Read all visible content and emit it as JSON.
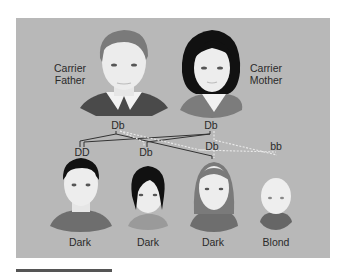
{
  "figure": {
    "parents": {
      "father": {
        "label_line1": "Carrier",
        "label_line2": "Father",
        "genotype": "Db"
      },
      "mother": {
        "label_line1": "Carrier",
        "label_line2": "Mother",
        "genotype": "Db"
      }
    },
    "offspring": [
      {
        "genotype": "DD",
        "phenotype": "Dark"
      },
      {
        "genotype": "Db",
        "phenotype": "Dark"
      },
      {
        "genotype": "Db",
        "phenotype": "Dark"
      },
      {
        "genotype": "bb",
        "phenotype": "Blond"
      }
    ],
    "colors": {
      "background": "#b8b8b8",
      "text": "#2a2a2a",
      "dominant_line": "#333333",
      "recessive_line": "#e8e8e8"
    }
  }
}
